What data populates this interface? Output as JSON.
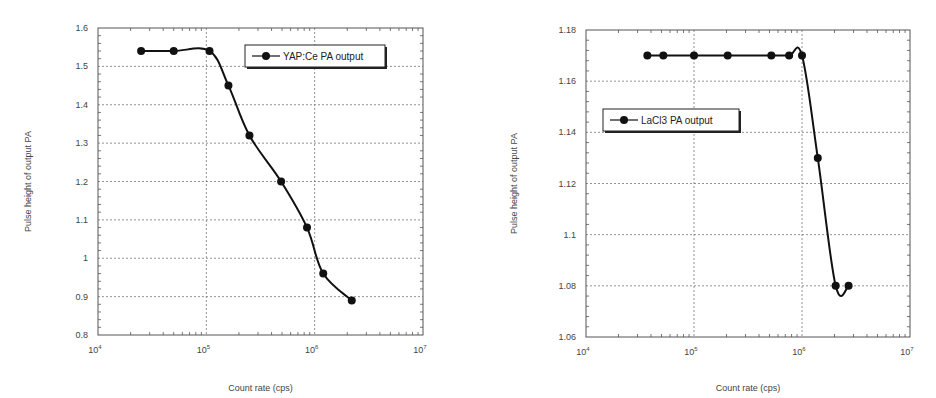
{
  "chart_data": [
    {
      "type": "line",
      "title": "",
      "xlabel": "Count rate (cps)",
      "ylabel": "Pulse height of output PA",
      "xscale": "log",
      "xlim": [
        10000,
        10000000
      ],
      "ylim": [
        0.8,
        1.6
      ],
      "x_ticks": [
        {
          "base": "10",
          "exp": "4"
        },
        {
          "base": "10",
          "exp": "5"
        },
        {
          "base": "10",
          "exp": "6"
        },
        {
          "base": "10",
          "exp": "7"
        }
      ],
      "y_ticks": [
        "0.8",
        "0.9",
        "1",
        "1.1",
        "1.2",
        "1.3",
        "1.4",
        "1.5",
        "1.6"
      ],
      "y_tick_values": [
        0.8,
        0.9,
        1.0,
        1.1,
        1.2,
        1.3,
        1.4,
        1.5,
        1.6
      ],
      "grid": true,
      "legend_position": "upper right",
      "series": [
        {
          "name": "YAP:Ce  PA output",
          "marker": "circle",
          "color": "#111111",
          "x": [
            25000,
            50000,
            107000,
            160000,
            250000,
            490000,
            850000,
            1200000,
            2200000
          ],
          "y": [
            1.54,
            1.54,
            1.54,
            1.45,
            1.32,
            1.2,
            1.08,
            0.96,
            0.89
          ]
        }
      ]
    },
    {
      "type": "line",
      "title": "",
      "xlabel": "Count rate (cps)",
      "ylabel": "Pulse height of output PA",
      "xscale": "log",
      "xlim": [
        10000,
        10000000
      ],
      "ylim": [
        1.06,
        1.18
      ],
      "x_ticks": [
        {
          "base": "10",
          "exp": "4"
        },
        {
          "base": "10",
          "exp": "5"
        },
        {
          "base": "10",
          "exp": "6"
        },
        {
          "base": "10",
          "exp": "7"
        }
      ],
      "y_ticks": [
        "1.06",
        "1.08",
        "1.1",
        "1.12",
        "1.14",
        "1.16",
        "1.18"
      ],
      "y_tick_values": [
        1.06,
        1.08,
        1.1,
        1.12,
        1.14,
        1.16,
        1.18
      ],
      "grid": true,
      "legend_position": "center left",
      "series": [
        {
          "name": "LaCl3  PA output",
          "marker": "circle",
          "color": "#111111",
          "x": [
            37000,
            52000,
            100000,
            205000,
            520000,
            760000,
            1000000,
            1400000,
            2050000,
            2700000
          ],
          "y": [
            1.17,
            1.17,
            1.17,
            1.17,
            1.17,
            1.17,
            1.17,
            1.13,
            1.08,
            1.08
          ]
        }
      ]
    }
  ],
  "layout": {
    "plots": [
      {
        "left": 98,
        "top": 28,
        "right": 423,
        "bottom": 335,
        "legend": {
          "x": 245,
          "y": 45,
          "w": 140,
          "h": 22
        },
        "ylabel_x": 31,
        "xlabel_y": 391
      },
      {
        "left": 586,
        "top": 30,
        "right": 910,
        "bottom": 337,
        "legend": {
          "x": 603,
          "y": 109,
          "w": 136,
          "h": 22
        },
        "ylabel_x": 517,
        "xlabel_y": 391
      }
    ]
  }
}
